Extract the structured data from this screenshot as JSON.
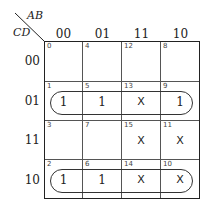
{
  "map": {
    "row_var": "CD",
    "col_var": "AB",
    "col_headers": [
      "00",
      "01",
      "11",
      "10"
    ],
    "row_headers": [
      "00",
      "01",
      "11",
      "10"
    ],
    "cells": [
      [
        {
          "idx": "0",
          "val": ""
        },
        {
          "idx": "4",
          "val": ""
        },
        {
          "idx": "12",
          "val": ""
        },
        {
          "idx": "8",
          "val": ""
        }
      ],
      [
        {
          "idx": "1",
          "val": "1"
        },
        {
          "idx": "5",
          "val": "1"
        },
        {
          "idx": "13",
          "val": "X"
        },
        {
          "idx": "9",
          "val": "1"
        }
      ],
      [
        {
          "idx": "3",
          "val": ""
        },
        {
          "idx": "7",
          "val": ""
        },
        {
          "idx": "15",
          "val": "X"
        },
        {
          "idx": "11",
          "val": "X"
        }
      ],
      [
        {
          "idx": "2",
          "val": "1"
        },
        {
          "idx": "6",
          "val": "1"
        },
        {
          "idx": "14",
          "val": "X"
        },
        {
          "idx": "10",
          "val": "X"
        }
      ]
    ],
    "groups": [
      "row-01",
      "row-10"
    ]
  }
}
